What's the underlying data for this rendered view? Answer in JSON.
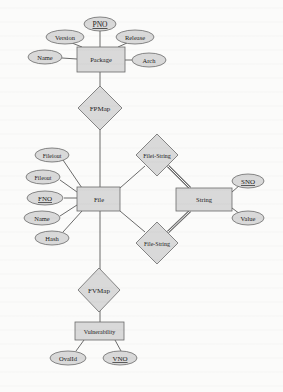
{
  "diagram": {
    "type": "entity-relationship",
    "colors": {
      "shape_fill": "#d9d9d9",
      "shape_stroke": "#6a6a6a",
      "line": "#5a5a5a",
      "text": "#222222",
      "background": "#fbfbfa"
    },
    "entities": {
      "package": {
        "label": "Package"
      },
      "file": {
        "label": "File"
      },
      "string": {
        "label": "String"
      },
      "vulnerability": {
        "label": "Vulnerability"
      }
    },
    "relationships": {
      "fpmap": {
        "label": "FPMap"
      },
      "filei_string": {
        "label": "Filei-String"
      },
      "file_string": {
        "label": "File-String"
      },
      "fvmap": {
        "label": "FVMap"
      }
    },
    "attributes": {
      "package": [
        {
          "label": "PNO",
          "key": true
        },
        {
          "label": "Version",
          "key": false
        },
        {
          "label": "Release",
          "key": false
        },
        {
          "label": "Name",
          "key": false
        },
        {
          "label": "Arch",
          "key": false
        }
      ],
      "file": [
        {
          "label": "Fileiout",
          "key": false
        },
        {
          "label": "Fileout",
          "key": false
        },
        {
          "label": "FNO",
          "key": true
        },
        {
          "label": "Name",
          "key": false
        },
        {
          "label": "Hash",
          "key": false
        }
      ],
      "string": [
        {
          "label": "SNO",
          "key": true
        },
        {
          "label": "Value",
          "key": false
        }
      ],
      "vulnerability": [
        {
          "label": "OvalId",
          "key": false
        },
        {
          "label": "VNO",
          "key": true
        }
      ]
    }
  }
}
